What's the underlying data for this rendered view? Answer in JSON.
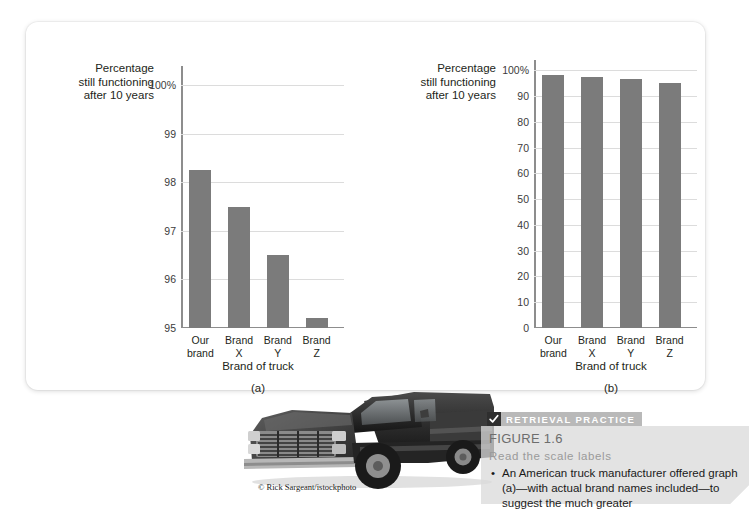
{
  "figure": {
    "panel_letter_a": "(a)",
    "panel_letter_b": "(b)"
  },
  "chart_data": [
    {
      "id": "chart-a",
      "type": "bar",
      "title": "",
      "ylabel": "Percentage\nstill functioning\nafter 10 years",
      "xlabel": "Brand of truck",
      "categories": [
        "Our\nbrand",
        "Brand\nX",
        "Brand\nY",
        "Brand\nZ"
      ],
      "values": [
        98.25,
        97.5,
        96.5,
        95.2
      ],
      "ylim": [
        95,
        100.4
      ],
      "yticks": [
        95,
        96,
        97,
        98,
        99,
        100
      ],
      "yticklabels": [
        "95",
        "96",
        "97",
        "98",
        "99",
        "100%"
      ],
      "grid": true,
      "bar_color": "#7b7b7b",
      "panel": "(a)"
    },
    {
      "id": "chart-b",
      "type": "bar",
      "title": "",
      "ylabel": "Percentage\nstill functioning\nafter 10 years",
      "xlabel": "Brand of truck",
      "categories": [
        "Our\nbrand",
        "Brand\nX",
        "Brand\nY",
        "Brand\nZ"
      ],
      "values": [
        98.2,
        97.5,
        96.5,
        95.2
      ],
      "ylim": [
        0,
        104
      ],
      "yticks": [
        0,
        10,
        20,
        30,
        40,
        50,
        60,
        70,
        80,
        90,
        100
      ],
      "yticklabels": [
        "0",
        "10",
        "20",
        "30",
        "40",
        "50",
        "60",
        "70",
        "80",
        "90",
        "100%"
      ],
      "grid": true,
      "bar_color": "#7b7b7b",
      "panel": "(b)"
    }
  ],
  "photo": {
    "alt_name": "pickup-truck-photo",
    "credit": "© Rick Sargeant/istockphoto"
  },
  "practice_card": {
    "banner_label": "RETRIEVAL PRACTICE",
    "check_icon": "check-icon",
    "figure_number": "FIGURE 1.6",
    "subtitle": "Read the scale labels",
    "bullet": "•",
    "body": "An American truck manufacturer offered graph (a)—with actual brand names included—to suggest the much greater"
  },
  "colors": {
    "bar": "#7b7b7b",
    "axis": "#8d8d8d",
    "gridline": "#dcdcdc",
    "banner": "#b9b9b9",
    "card_shadow": "#d9d9d9",
    "text": "#231f20"
  }
}
